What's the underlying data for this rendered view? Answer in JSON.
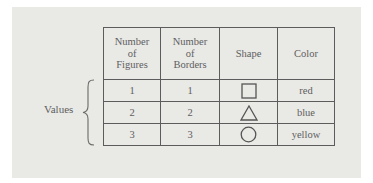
{
  "figure": {
    "row_group_label": "Values",
    "table": {
      "headers": [
        "Number of Figures",
        "Number of Borders",
        "Shape",
        "Color"
      ],
      "header_lines": [
        [
          "Number",
          "of",
          "Figures"
        ],
        [
          "Number",
          "of",
          "Borders"
        ],
        [
          "Shape"
        ],
        [
          "Color"
        ]
      ],
      "rows": [
        {
          "figures": "1",
          "borders": "1",
          "shape": "square-icon",
          "color": "red"
        },
        {
          "figures": "2",
          "borders": "2",
          "shape": "triangle-icon",
          "color": "blue"
        },
        {
          "figures": "3",
          "borders": "3",
          "shape": "circle-icon",
          "color": "yellow"
        }
      ]
    }
  },
  "colors": {
    "panel_background": "#e9e9e6",
    "rule": "#5c5c5c",
    "text": "#5e5e5e"
  }
}
